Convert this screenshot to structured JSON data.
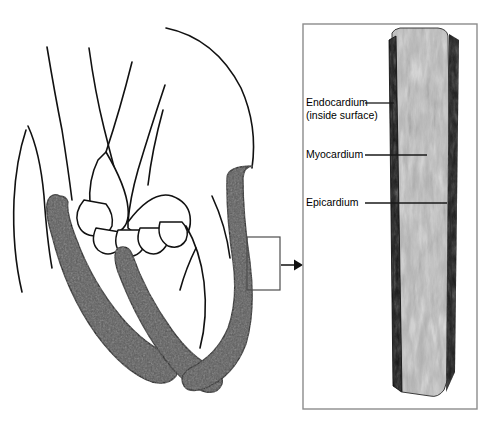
{
  "figure": {
    "panel": {
      "border_color": "#8c8c8c",
      "background": "#ffffff"
    },
    "labels": [
      {
        "id": "endocardium",
        "text": "Endocardium",
        "sub": "(inside surface)"
      },
      {
        "id": "myocardium",
        "text": "Myocardium",
        "sub": ""
      },
      {
        "id": "epicardium",
        "text": "Epicardium",
        "sub": ""
      }
    ],
    "callout": {
      "box_label": "magnification-region",
      "arrow_label": "callout-arrow"
    },
    "colors": {
      "myocardium_fill": "#5a5a5a",
      "outline": "#111111",
      "leader": "#1a1a1a",
      "specimen_dark": "#151515",
      "specimen_mid": "#8a8a8a",
      "specimen_light": "#e8e8e8"
    }
  }
}
